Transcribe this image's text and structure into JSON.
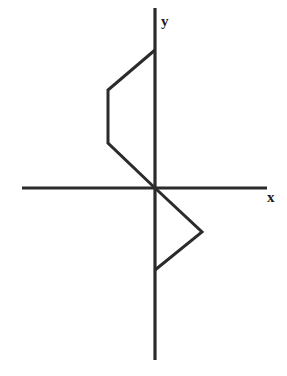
{
  "figure": {
    "background_color": "#ffffff",
    "stroke_color": "#2b2b2b",
    "width": 287,
    "height": 376,
    "origin": {
      "x": 155,
      "y": 188
    }
  },
  "axes": {
    "x_axis": {
      "label": "x",
      "label_position": {
        "x": 267,
        "y": 190
      },
      "start": {
        "x": 22,
        "y": 188
      },
      "end": {
        "x": 267,
        "y": 188
      },
      "orientation": "horizontal",
      "stroke_width": 3.2
    },
    "y_axis": {
      "label": "y",
      "label_position": {
        "x": 161,
        "y": 14
      },
      "start": {
        "x": 155,
        "y": 8
      },
      "end": {
        "x": 155,
        "y": 360
      },
      "orientation": "vertical",
      "stroke_width": 3.2
    }
  },
  "shapes": [
    {
      "name": "upper-left-trapezoid",
      "description": "Open trapezoid in the second quadrant, left of the y-axis and above the x-axis, with its open side lying along the y-axis.",
      "quadrant": "II",
      "closed": false,
      "points": "155,50 108,90 108,143 155,188",
      "vertices": [
        {
          "x": 155,
          "y": 50
        },
        {
          "x": 108,
          "y": 90
        },
        {
          "x": 108,
          "y": 143
        },
        {
          "x": 155,
          "y": 188
        }
      ]
    },
    {
      "name": "lower-right-triangle",
      "description": "Open triangle in the fourth quadrant, right of the y-axis and below the x-axis, with its open side lying along the y-axis.",
      "quadrant": "IV",
      "closed": false,
      "points": "155,188 202,232 155,270",
      "vertices": [
        {
          "x": 155,
          "y": 188
        },
        {
          "x": 202,
          "y": 232
        },
        {
          "x": 155,
          "y": 270
        }
      ]
    }
  ],
  "chart_data": {
    "type": "line",
    "title": "",
    "xlabel": "x",
    "ylabel": "y",
    "grid": false,
    "legend": "none",
    "series": [
      {
        "name": "upper-left-trapezoid",
        "x": [
          0,
          -47,
          -47,
          0
        ],
        "y": [
          138,
          98,
          45,
          0
        ]
      },
      {
        "name": "lower-right-triangle",
        "x": [
          0,
          47,
          0
        ],
        "y": [
          0,
          -44,
          -82
        ]
      }
    ],
    "annotations": [
      "x",
      "y"
    ]
  }
}
